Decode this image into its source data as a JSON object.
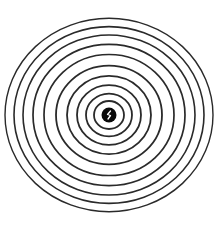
{
  "figure": {
    "background": "#ffffff",
    "stroke_color": "#2a2a2a",
    "center": {
      "x": 109,
      "y": 115
    },
    "aspect_y": 0.93,
    "rings_rx": [
      104,
      95,
      86,
      76,
      65,
      53,
      42,
      32,
      23,
      15
    ],
    "stroke_widths": [
      1.4,
      1.6,
      1.6,
      1.7,
      1.7,
      1.8,
      1.8,
      1.8,
      1.8,
      1.8
    ],
    "center_dot": {
      "r": 7.5,
      "color": "#0a0a0a",
      "glyph_color": "#ffffff"
    }
  }
}
